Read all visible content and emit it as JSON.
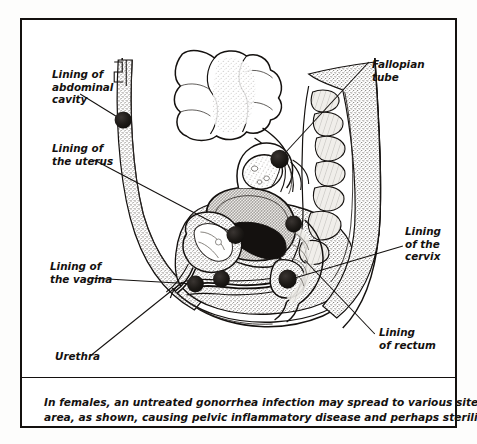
{
  "figure": {
    "type": "medical-anatomical-diagram",
    "view": "sagittal-midline-section"
  },
  "labels": [
    {
      "id": "abdominal-cavity",
      "name": "label-lining-of-abdominal-cavity",
      "lines": [
        "Lining of",
        "abdominal",
        "cavity"
      ],
      "side": "left"
    },
    {
      "id": "uterus",
      "name": "label-lining-of-the-uterus",
      "lines": [
        "Lining of",
        "the uterus"
      ],
      "side": "left"
    },
    {
      "id": "vagina",
      "name": "label-lining-of-the-vagina",
      "lines": [
        "Lining of",
        "the vagina"
      ],
      "side": "left"
    },
    {
      "id": "urethra",
      "name": "label-urethra",
      "lines": [
        "Urethra"
      ],
      "side": "left"
    },
    {
      "id": "fallopian-tube",
      "name": "label-fallopian-tube",
      "lines": [
        "Fallopian",
        "tube"
      ],
      "side": "right"
    },
    {
      "id": "cervix",
      "name": "label-lining-of-the-cervix",
      "lines": [
        "Lining",
        "of the",
        "cervix"
      ],
      "side": "right"
    },
    {
      "id": "rectum",
      "name": "label-lining-of-rectum",
      "lines": [
        "Lining",
        "of rectum"
      ],
      "side": "right"
    }
  ],
  "label_text": {
    "abdominal_1": "Lining of",
    "abdominal_2": "abdominal",
    "abdominal_3": "cavity",
    "uterus_1": "Lining of",
    "uterus_2": "the uterus",
    "vagina_1": "Lining of",
    "vagina_2": "the vagina",
    "urethra_1": "Urethra",
    "fallopian_1": "Fallopian",
    "fallopian_2": "tube",
    "cervix_1": "Lining",
    "cervix_2": "of the",
    "cervix_3": "cervix",
    "rectum_1": "Lining",
    "rectum_2": "of rectum"
  },
  "caption": {
    "line1": "In females, an untreated gonorrhea infection may spread to various sites in the pelvic",
    "line2": "area, as shown, causing pelvic inflammatory disease and perhaps sterility.",
    "full": "In females, an untreated gonorrhea infection may spread to various sites in the pelvic area, as shown, causing pelvic inflammatory disease and perhaps sterility."
  },
  "infection_markers": {
    "count": 6,
    "description": "Dark filled circles marking infection sites",
    "sites": [
      "abdominal cavity lining",
      "fallopian tube",
      "uterus lining",
      "vagina lining",
      "urethra",
      "cervix lining",
      "rectum lining"
    ]
  },
  "colors": {
    "frame_border": "#14110f",
    "ink": "#14110f",
    "paper": "#ffffff",
    "page_background": "#fdfdfc",
    "marker_fill": "#1a1715",
    "tissue_stipple": "#8d8a86",
    "tissue_light": "#e8e5e0",
    "tissue_mid": "#cfcbc5"
  }
}
